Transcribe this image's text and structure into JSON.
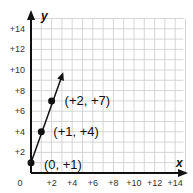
{
  "chart_data": {
    "type": "line",
    "title": "",
    "xlabel": "x",
    "ylabel": "y",
    "xlim": [
      0,
      14
    ],
    "ylim": [
      0,
      14
    ],
    "grid": true,
    "x_ticks": [
      "+2",
      "+4",
      "+6",
      "+8",
      "+10",
      "+12",
      "+14"
    ],
    "y_ticks": [
      "+2",
      "+4",
      "+6",
      "+8",
      "+10",
      "+12",
      "+14"
    ],
    "origin_label": "0",
    "series": [
      {
        "name": "line",
        "points": [
          [
            0,
            1
          ],
          [
            1,
            4
          ],
          [
            2,
            7
          ]
        ],
        "extends_with_arrow_to": [
          3,
          10
        ]
      }
    ],
    "annotations": [
      {
        "text": "(0, +1)",
        "at": [
          0,
          1
        ]
      },
      {
        "text": "(+1, +4)",
        "at": [
          1,
          4
        ]
      },
      {
        "text": "(+2, +7)",
        "at": [
          2,
          7
        ]
      }
    ],
    "colors": {
      "grid": "#cccccc",
      "axis": "#111111",
      "line": "#111111"
    }
  }
}
